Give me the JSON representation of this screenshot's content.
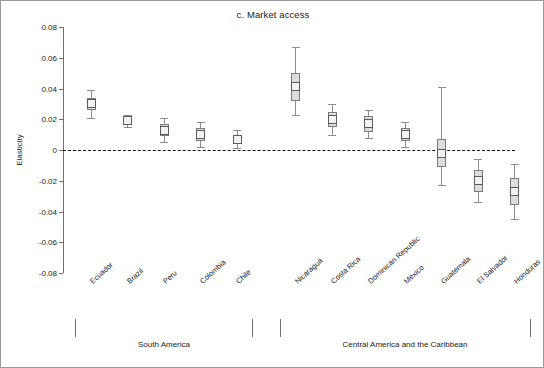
{
  "chart_data": {
    "type": "scatter",
    "title": "c. Market access",
    "ylabel": "Elasticity",
    "xlabel": "",
    "ylim": [
      -0.08,
      0.08
    ],
    "yticks": [
      0.08,
      0.06,
      0.04,
      0.02,
      0,
      -0.02,
      -0.04,
      -0.06,
      -0.08
    ],
    "ytick_labels": [
      "0.08",
      "0.06",
      "0.04",
      "0.02",
      "0",
      "-0.02",
      "-0.04",
      "-0.06",
      "-0.08"
    ],
    "grid": false,
    "legend": "none",
    "zero_reference_line": 0,
    "categories": [
      "Ecuador",
      "Brazil",
      "Peru",
      "Colombia",
      "Chile",
      "Nicaragua",
      "Costa Rica",
      "Dominican Republic",
      "Mexico",
      "Guatemala",
      "El Salvador",
      "Honduras"
    ],
    "series": [
      {
        "name": "Elasticity estimate",
        "values": [
          0.03,
          0.019,
          0.013,
          0.01,
          0.007,
          0.041,
          0.02,
          0.017,
          0.01,
          -0.002,
          -0.02,
          -0.027
        ]
      },
      {
        "name": "Inner interval (box) lower",
        "values": [
          0.026,
          0.017,
          0.009,
          0.006,
          0.004,
          0.032,
          0.015,
          0.012,
          0.006,
          -0.011,
          -0.027,
          -0.036
        ]
      },
      {
        "name": "Inner interval (box) upper",
        "values": [
          0.034,
          0.021,
          0.017,
          0.014,
          0.01,
          0.05,
          0.025,
          0.022,
          0.014,
          0.007,
          -0.013,
          -0.018
        ]
      },
      {
        "name": "Outer interval (whisker) lower",
        "values": [
          0.021,
          0.015,
          0.005,
          0.002,
          0.001,
          0.023,
          0.01,
          0.008,
          0.002,
          -0.023,
          -0.034,
          -0.045
        ]
      },
      {
        "name": "Outer interval (whisker) upper",
        "values": [
          0.039,
          0.023,
          0.021,
          0.018,
          0.013,
          0.067,
          0.03,
          0.026,
          0.018,
          0.041,
          -0.006,
          -0.009
        ]
      }
    ],
    "groups": [
      {
        "label": "South America",
        "start_index": 0,
        "end_index": 4
      },
      {
        "label": "Central America and the Caribbean",
        "start_index": 5,
        "end_index": 11
      }
    ],
    "colors": {
      "marker_fill": "#f2f2f2",
      "marker_edge": "#5c5c5c",
      "box_fill": "#dcdcdc",
      "box_edge": "#7b7b7b",
      "whisker": "#8d8d8d",
      "axis": "#6f6f6f",
      "zero_line": "#111111",
      "text": "#1a1a1a",
      "frame": "#9a9a9a"
    }
  }
}
